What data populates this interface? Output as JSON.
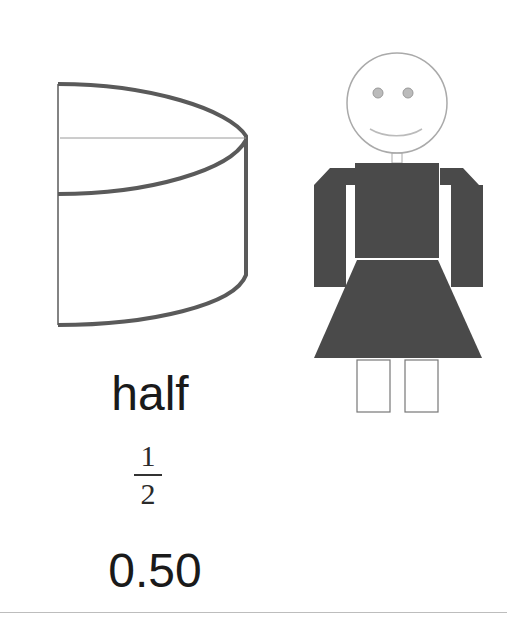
{
  "figure": {
    "shape": "cylinder-half",
    "person": "girl-stick-figure"
  },
  "labels": {
    "word": "half",
    "fraction": {
      "numerator": "1",
      "denominator": "2"
    },
    "decimal": "0.50"
  },
  "colors": {
    "outline": "#555555",
    "dress": "#4a4a4a",
    "text": "#1a1a1a"
  }
}
